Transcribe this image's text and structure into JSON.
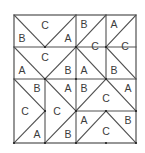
{
  "diagram": {
    "title": "",
    "frame": {
      "x": 14,
      "y": 15,
      "width": 122,
      "height": 128
    },
    "line_color": "#505050",
    "label_color": "#3c3c3c",
    "lines": [
      [
        14,
        47,
        136,
        47
      ],
      [
        14,
        79,
        136,
        79
      ],
      [
        76,
        15,
        76,
        143
      ],
      [
        106,
        15,
        106,
        79
      ],
      [
        45,
        79,
        45,
        143
      ],
      [
        76,
        111,
        136,
        111
      ],
      [
        14,
        15,
        45,
        47
      ],
      [
        45,
        47,
        76,
        15
      ],
      [
        14,
        47,
        45,
        79
      ],
      [
        45,
        79,
        76,
        47
      ],
      [
        106,
        15,
        76,
        47
      ],
      [
        76,
        47,
        106,
        79
      ],
      [
        136,
        15,
        106,
        47
      ],
      [
        106,
        47,
        136,
        79
      ],
      [
        14,
        79,
        45,
        111
      ],
      [
        45,
        111,
        14,
        143
      ],
      [
        45,
        79,
        76,
        111
      ],
      [
        76,
        111,
        45,
        143
      ],
      [
        76,
        111,
        106,
        79
      ],
      [
        106,
        79,
        136,
        111
      ],
      [
        76,
        143,
        106,
        111
      ],
      [
        106,
        111,
        136,
        143
      ]
    ],
    "dots": [
      [
        45,
        47
      ],
      [
        76,
        47
      ],
      [
        106,
        47
      ],
      [
        45,
        79
      ],
      [
        76,
        79
      ],
      [
        106,
        79
      ],
      [
        45,
        111
      ],
      [
        76,
        111
      ],
      [
        106,
        111
      ],
      [
        136,
        111
      ],
      [
        14,
        143
      ],
      [
        45,
        143
      ],
      [
        76,
        143
      ],
      [
        106,
        143
      ],
      [
        136,
        143
      ]
    ],
    "labels": [
      {
        "text": "B",
        "x": 22,
        "y": 38
      },
      {
        "text": "C",
        "x": 45,
        "y": 25
      },
      {
        "text": "A",
        "x": 68,
        "y": 38
      },
      {
        "text": "A",
        "x": 22,
        "y": 70
      },
      {
        "text": "C",
        "x": 45,
        "y": 57
      },
      {
        "text": "B",
        "x": 68,
        "y": 70
      },
      {
        "text": "B",
        "x": 84,
        "y": 24
      },
      {
        "text": "C",
        "x": 95,
        "y": 46
      },
      {
        "text": "A",
        "x": 84,
        "y": 70
      },
      {
        "text": "A",
        "x": 114,
        "y": 24
      },
      {
        "text": "C",
        "x": 125,
        "y": 46
      },
      {
        "text": "B",
        "x": 114,
        "y": 70
      },
      {
        "text": "B",
        "x": 37,
        "y": 88
      },
      {
        "text": "C",
        "x": 25,
        "y": 111
      },
      {
        "text": "A",
        "x": 37,
        "y": 134
      },
      {
        "text": "A",
        "x": 68,
        "y": 88
      },
      {
        "text": "C",
        "x": 57,
        "y": 111
      },
      {
        "text": "B",
        "x": 68,
        "y": 134
      },
      {
        "text": "B",
        "x": 84,
        "y": 88
      },
      {
        "text": "C",
        "x": 106,
        "y": 98
      },
      {
        "text": "A",
        "x": 128,
        "y": 88
      },
      {
        "text": "A",
        "x": 84,
        "y": 120
      },
      {
        "text": "C",
        "x": 106,
        "y": 131
      },
      {
        "text": "B",
        "x": 128,
        "y": 120
      }
    ]
  }
}
